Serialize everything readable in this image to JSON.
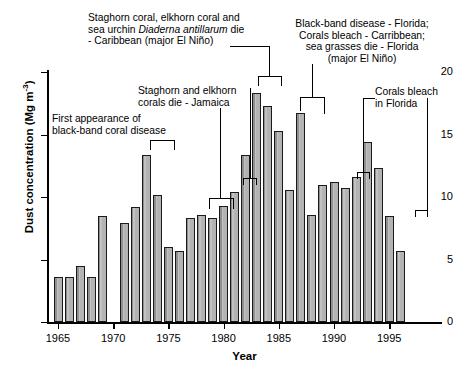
{
  "chart_data": {
    "type": "bar",
    "title": "",
    "xlabel": "Year",
    "ylabel": "Dust concentration (Mg m-3)",
    "ylabel_html": "Dust concentration (Mg m<sup>-3</sup>)",
    "xlim": [
      1964.3,
      1996.4
    ],
    "ylim": [
      0,
      20
    ],
    "yticks": [
      0,
      5,
      10,
      15,
      20
    ],
    "xticks": [
      1965,
      1970,
      1975,
      1980,
      1985,
      1990,
      1995
    ],
    "grid": false,
    "legend": "none",
    "categories": [
      1965,
      1966,
      1967,
      1968,
      1969,
      1971,
      1972,
      1973,
      1974,
      1975,
      1976,
      1977,
      1978,
      1979,
      1980,
      1981,
      1982,
      1983,
      1984,
      1985,
      1986,
      1987,
      1988,
      1989,
      1990,
      1991,
      1992,
      1993,
      1994,
      1995,
      1996
    ],
    "values": [
      3.6,
      3.6,
      4.5,
      3.6,
      8.5,
      7.9,
      9.2,
      13.4,
      10.2,
      6.0,
      5.7,
      8.3,
      8.6,
      8.3,
      9.3,
      10.4,
      13.4,
      18.3,
      17.3,
      15.3,
      10.6,
      16.7,
      8.6,
      11.0,
      11.2,
      10.7,
      11.6,
      14.4,
      12.3,
      8.5,
      5.7
    ],
    "missing_years": [
      1970
    ]
  },
  "axis": {
    "y_labels": [
      "0",
      "5",
      "10",
      "15",
      "20"
    ],
    "x_labels": [
      "1965",
      "1970",
      "1975",
      "1980",
      "1985",
      "1990",
      "1995"
    ],
    "y_title_prefix": "Dust concentration (Mg m",
    "y_title_sup": "-3",
    "y_title_suffix": ")",
    "x_title": "Year"
  },
  "annotations": [
    {
      "id": "first-appearance",
      "lines": [
        "First appearance of",
        "black-band coral disease"
      ],
      "target_years": [
        1973,
        1974
      ]
    },
    {
      "id": "staghorn-elkhorn-jamaica",
      "lines": [
        "Staghorn and elkhorn",
        "corals die - Jamaica"
      ],
      "target_years": [
        1978,
        1979
      ]
    },
    {
      "id": "staghorn-elkhorn-seaurchin-caribbean",
      "lines": [
        "Staghorn coral, elkhorn coral and",
        "sea urchin Diaderna antillarum die",
        "- Caribbean (major El Nino)"
      ],
      "line2_pre": "sea urchin ",
      "line2_italic": "Diaderna antillarum",
      "line2_post": " die",
      "line3": "- Caribbean (major El Niño)",
      "target_years": [
        1982,
        1983
      ]
    },
    {
      "id": "black-band-florida",
      "lines": [
        "Black-band disease - Florida;",
        "Corals bleach - Carribbean;",
        "sea grasses die - Florida",
        "(major El Niño)"
      ],
      "target_years": [
        1985,
        1987
      ]
    },
    {
      "id": "corals-bleach-florida",
      "lines": [
        "Corals bleach",
        "in Florida"
      ],
      "target_years": [
        1990,
        1995
      ]
    },
    {
      "id": "small-bracket-1981",
      "lines": [],
      "target_years": [
        1981
      ]
    }
  ]
}
